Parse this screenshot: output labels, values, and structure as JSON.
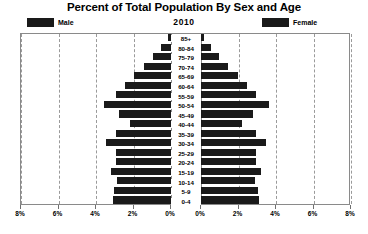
{
  "title": "Percent of Total Population By Sex and Age",
  "year": "2010",
  "legend": {
    "male_label": "Male",
    "female_label": "Female",
    "male_color": "#1a1a1a",
    "female_color": "#1a1a1a"
  },
  "axis": {
    "tick_labels": [
      "8%",
      "6%",
      "4%",
      "2%",
      "0%",
      "0%",
      "2%",
      "4%",
      "6%",
      "8%"
    ],
    "max_percent": 8,
    "step_percent": 2
  },
  "chart_data": {
    "type": "bar",
    "subtype": "population-pyramid",
    "title": "Percent of Total Population By Sex and Age",
    "subtitle": "2010",
    "xlabel": "",
    "ylabel": "",
    "xlim": [
      -8,
      8
    ],
    "grid": true,
    "legend_position": "top",
    "mirrored": true,
    "categories": [
      "85+",
      "80-84",
      "75-79",
      "70-74",
      "65-69",
      "60-64",
      "55-59",
      "50-54",
      "45-49",
      "40-44",
      "35-39",
      "30-34",
      "25-29",
      "20-24",
      "15-19",
      "10-14",
      "5-9",
      "0-4"
    ],
    "series": [
      {
        "name": "Male",
        "side": "left",
        "values": [
          0.15,
          0.55,
          0.95,
          1.45,
          1.95,
          2.45,
          2.95,
          3.6,
          2.75,
          2.2,
          2.95,
          3.45,
          2.95,
          2.95,
          3.2,
          2.9,
          3.05,
          3.1
        ]
      },
      {
        "name": "Female",
        "side": "right",
        "values": [
          0.15,
          0.55,
          0.95,
          1.45,
          1.95,
          2.45,
          2.95,
          3.6,
          2.75,
          2.2,
          2.95,
          3.45,
          2.95,
          2.95,
          3.2,
          2.9,
          3.05,
          3.1
        ]
      }
    ]
  }
}
